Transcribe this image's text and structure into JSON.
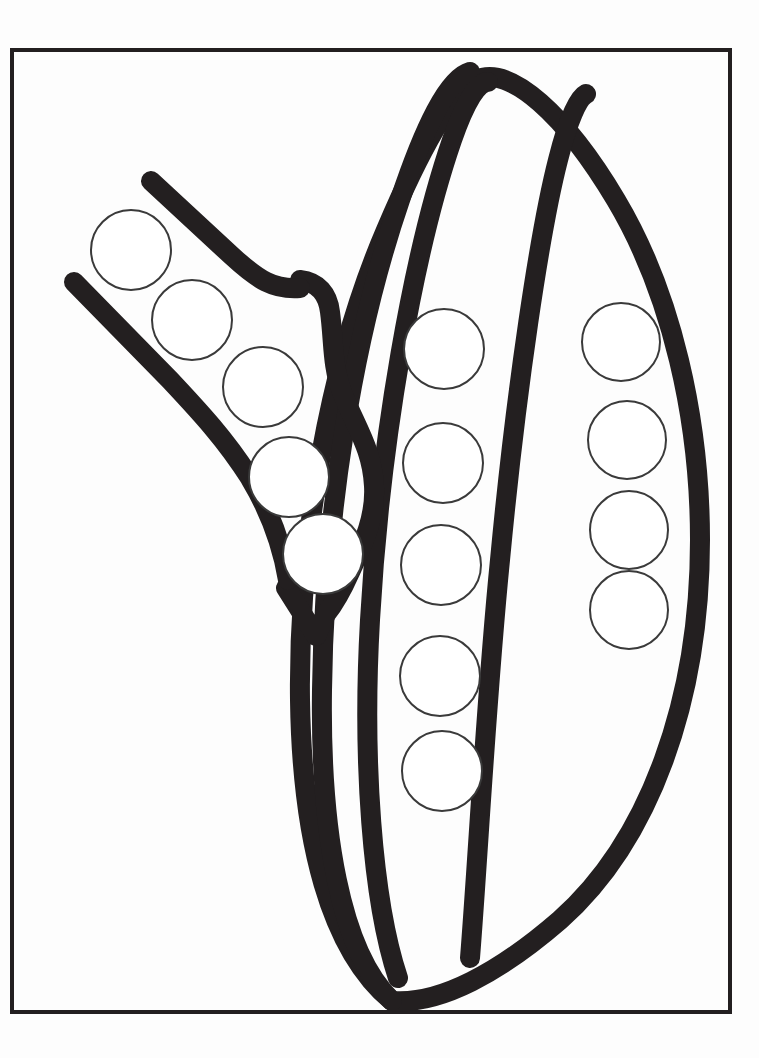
{
  "page": {
    "background_color": "#fdfdfd",
    "width": 759,
    "height": 1058
  },
  "colors": {
    "ink": "#231f20",
    "frame": "#231f20",
    "paper": "#ffffff",
    "circle_outline": "#3a3a3a"
  },
  "frame": {
    "name": "page-border-frame",
    "x": 12,
    "y": 50,
    "width": 718,
    "height": 962,
    "stroke_width": 4
  },
  "artwork": {
    "subject": "pea-pod",
    "line_width": 20,
    "stroke_linecap": "round",
    "stroke_linejoin": "round",
    "parts": [
      {
        "name": "pod-outer-shell",
        "label": "Outer pod shell"
      },
      {
        "name": "pod-inner-seam-left",
        "label": "Inner seam left"
      },
      {
        "name": "pod-inner-seam-right",
        "label": "Inner seam right"
      },
      {
        "name": "pod-open-edge",
        "label": "Open pod edge"
      },
      {
        "name": "calyx-sepal",
        "label": "Calyx / sepal"
      },
      {
        "name": "stem-upper-branch",
        "label": "Upper stem branch"
      },
      {
        "name": "stem-lower-branch",
        "label": "Lower stem branch"
      }
    ]
  },
  "dot_circles": {
    "radius": 40,
    "stroke_width": 2,
    "total_count": 14,
    "groups": [
      {
        "name": "calyx-dot-group",
        "label": "Calyx peas",
        "count": 5,
        "centers": [
          {
            "cx": 131,
            "cy": 250,
            "r": 40
          },
          {
            "cx": 192,
            "cy": 320,
            "r": 40
          },
          {
            "cx": 263,
            "cy": 387,
            "r": 40
          },
          {
            "cx": 289,
            "cy": 477,
            "r": 40
          },
          {
            "cx": 323,
            "cy": 554,
            "r": 40
          }
        ]
      },
      {
        "name": "middle-pod-dot-group",
        "label": "Middle pod peas",
        "count": 5,
        "centers": [
          {
            "cx": 444,
            "cy": 349,
            "r": 40
          },
          {
            "cx": 443,
            "cy": 463,
            "r": 40
          },
          {
            "cx": 441,
            "cy": 565,
            "r": 40
          },
          {
            "cx": 440,
            "cy": 676,
            "r": 40
          },
          {
            "cx": 442,
            "cy": 771,
            "r": 40
          }
        ]
      },
      {
        "name": "right-pod-dot-group",
        "label": "Right pod peas",
        "count": 4,
        "centers": [
          {
            "cx": 621,
            "cy": 342,
            "r": 39
          },
          {
            "cx": 627,
            "cy": 440,
            "r": 39
          },
          {
            "cx": 629,
            "cy": 530,
            "r": 39
          },
          {
            "cx": 629,
            "cy": 610,
            "r": 39
          }
        ]
      }
    ]
  }
}
